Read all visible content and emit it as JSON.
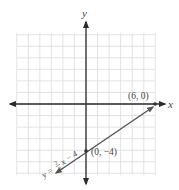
{
  "chart_data": {
    "type": "line",
    "title": "",
    "xlabel": "x",
    "ylabel": "y",
    "grid": true,
    "xlim": [
      -7,
      6
    ],
    "ylim": [
      -6,
      6
    ],
    "series": [
      {
        "name": "y = (2/3)x − 4",
        "equation": "y = 2/3 x − 4",
        "slope": 0.6667,
        "intercept": -4,
        "x": [
          -3,
          0,
          6
        ],
        "y": [
          -6,
          -4,
          0
        ],
        "color": "#555555"
      }
    ],
    "points": [
      {
        "label": "(6, 0)",
        "x": 6,
        "y": 0
      },
      {
        "label": "(0, −4)",
        "x": 0,
        "y": -4
      }
    ]
  },
  "labels": {
    "x_axis": "x",
    "y_axis": "y",
    "point_a": "(6, 0)",
    "point_b": "(0, −4)",
    "eq_prefix": "y =",
    "eq_num": "2",
    "eq_den": "3",
    "eq_suffix": "x − 4"
  },
  "colors": {
    "grid": "#dcdcdc",
    "axis": "#2a2a2a",
    "line": "#555555"
  }
}
